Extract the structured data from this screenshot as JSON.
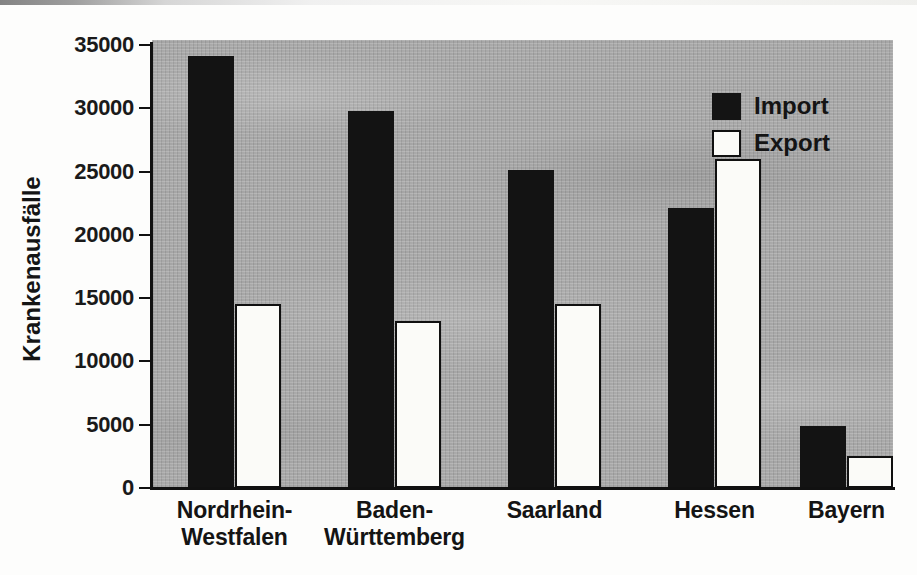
{
  "chart_data": {
    "type": "bar",
    "title": "",
    "subtitle": "",
    "xlabel": "",
    "ylabel": "Krankenausfälle",
    "categories": [
      "Nordrhein-\nWestfalen",
      "Baden-\nWürttemberg",
      "Saarland",
      "Hessen",
      "Bayern"
    ],
    "category_lines": [
      [
        "Nordrhein-",
        "Westfalen"
      ],
      [
        "Baden-",
        "Württemberg"
      ],
      [
        "Saarland",
        ""
      ],
      [
        "Hessen",
        ""
      ],
      [
        "Bayern",
        ""
      ]
    ],
    "series": [
      {
        "name": "Import",
        "color": "#131313",
        "values": [
          34100,
          29800,
          25100,
          22100,
          4900
        ]
      },
      {
        "name": "Export",
        "color": "#fbfbf8",
        "values": [
          14500,
          13200,
          14500,
          26000,
          2500
        ]
      }
    ],
    "ylim": [
      0,
      35000
    ],
    "yticks": [
      0,
      5000,
      10000,
      15000,
      20000,
      25000,
      30000,
      35000
    ],
    "ytick_labels": [
      "0",
      "5000",
      "10000",
      "15000",
      "20000",
      "25000",
      "30000",
      "35000"
    ],
    "grid": false,
    "legend_position": "top-right",
    "plot_background_color": "#a9a9a9",
    "axis_color": "#111111"
  },
  "legend": {
    "entries": [
      {
        "label": "Import",
        "swatch": "filled-black-square"
      },
      {
        "label": "Export",
        "swatch": "outlined-white-square"
      }
    ]
  }
}
